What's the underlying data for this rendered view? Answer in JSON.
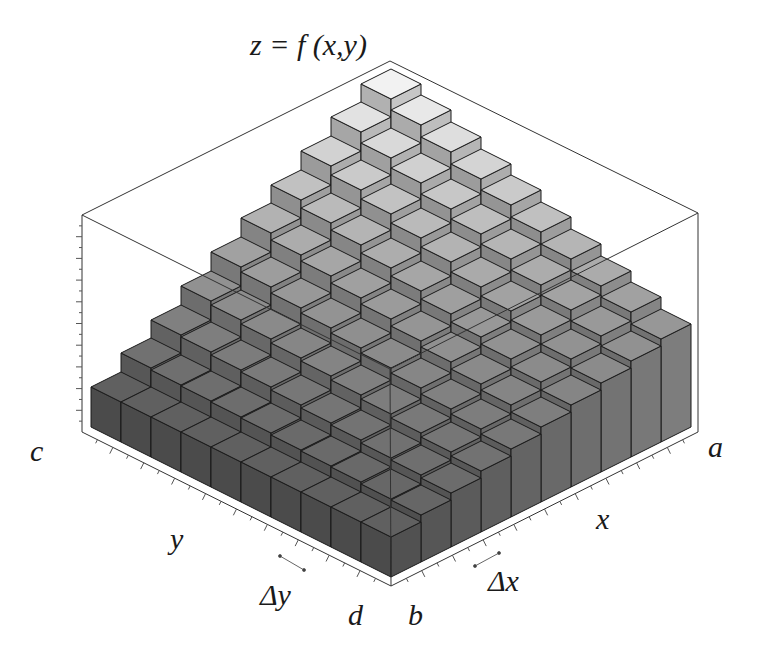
{
  "chart_data": {
    "type": "bar3d",
    "xlabel": "x",
    "ylabel": "y",
    "zlabel": "z = f(x,y)",
    "x_range_labels": {
      "start": "b",
      "end": "a"
    },
    "y_range_labels": {
      "start": "d",
      "end": "c"
    },
    "x_step_label": "Δx",
    "y_step_label": "Δy",
    "grid_size": [
      10,
      10
    ],
    "heights_note": "relative bar heights in px; row i = x index (b→a), column j = y index (d→c)",
    "heights": [
      [
        40,
        40,
        40,
        40,
        40,
        40,
        40,
        40,
        40,
        40
      ],
      [
        47,
        48,
        50,
        51,
        52,
        54,
        55,
        56,
        57,
        59
      ],
      [
        54,
        57,
        59,
        62,
        64,
        67,
        70,
        72,
        75,
        77
      ],
      [
        61,
        65,
        69,
        73,
        77,
        81,
        84,
        88,
        92,
        96
      ],
      [
        68,
        73,
        78,
        84,
        89,
        94,
        99,
        104,
        110,
        115
      ],
      [
        75,
        82,
        88,
        95,
        101,
        108,
        114,
        121,
        127,
        134
      ],
      [
        82,
        90,
        98,
        105,
        113,
        121,
        129,
        137,
        144,
        152
      ],
      [
        89,
        98,
        107,
        116,
        125,
        135,
        144,
        153,
        162,
        171
      ],
      [
        96,
        106,
        117,
        127,
        138,
        148,
        158,
        169,
        179,
        190
      ],
      [
        103,
        115,
        126,
        138,
        150,
        162,
        173,
        185,
        197,
        208
      ]
    ],
    "grid": false,
    "legend": null,
    "colors": {
      "low_top": "#606060",
      "high_top": "#f2f2f2",
      "edge": "#1a1a1a",
      "box": "#333333"
    }
  },
  "labels": {
    "z_eq": "z = f (x,y)",
    "c": "c",
    "a": "a",
    "y": "y",
    "x": "x",
    "dy": "Δy",
    "dx": "Δx",
    "d": "d",
    "b": "b"
  }
}
